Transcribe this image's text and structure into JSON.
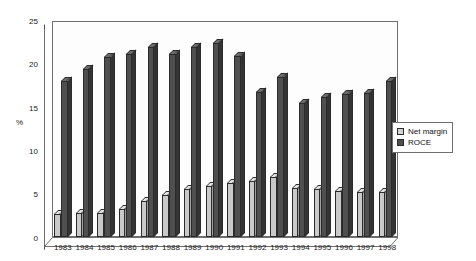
{
  "chart_data": {
    "type": "bar",
    "title": "",
    "xlabel": "",
    "ylabel": "%",
    "ylim": [
      0,
      25
    ],
    "yticks": [
      0,
      5,
      10,
      15,
      20,
      25
    ],
    "grid": false,
    "legend_position": "right",
    "categories": [
      "1983",
      "1984",
      "1985",
      "1986",
      "1987",
      "1988",
      "1989",
      "1990",
      "1991",
      "1992",
      "1993",
      "1994",
      "1995",
      "1996",
      "1997",
      "1998"
    ],
    "series": [
      {
        "name": "Net margin",
        "color": "#c9c9c9",
        "values": [
          2.7,
          2.8,
          2.8,
          3.3,
          4.2,
          4.9,
          5.5,
          5.9,
          6.2,
          6.5,
          7.0,
          5.7,
          5.5,
          5.3,
          5.2,
          5.2
        ]
      },
      {
        "name": "ROCE",
        "color": "#4f4f4f",
        "values": [
          18.0,
          19.5,
          20.8,
          21.2,
          22.0,
          21.2,
          22.0,
          22.5,
          21.0,
          16.8,
          18.5,
          15.5,
          16.2,
          16.5,
          16.7,
          18.0
        ]
      }
    ]
  },
  "legend": {
    "items": [
      {
        "label": "Net margin",
        "swatch": "legend-swatch-net-margin"
      },
      {
        "label": "ROCE",
        "swatch": "legend-swatch-roce"
      }
    ]
  },
  "axis": {
    "y_title": "%",
    "y_tick_labels": [
      "25",
      "20",
      "15",
      "10",
      "5",
      "0"
    ]
  }
}
